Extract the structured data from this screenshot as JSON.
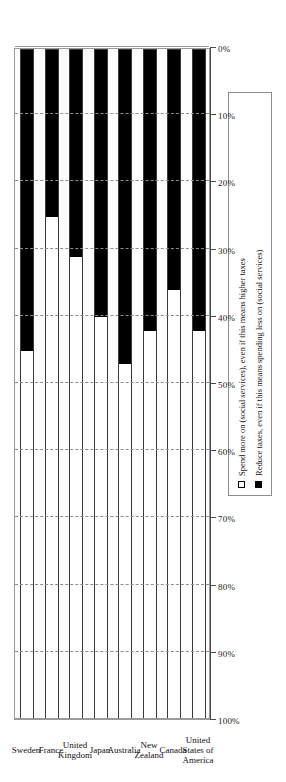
{
  "chart_data": {
    "type": "bar",
    "title": "",
    "subtitle": "",
    "xlabel": "",
    "ylabel": "",
    "orientation": "horizontal-stacked",
    "stacked": true,
    "grid": true,
    "axis_reversed": true,
    "axis_ticks": [
      "100%",
      "90%",
      "80%",
      "70%",
      "60%",
      "50%",
      "40%",
      "30%",
      "20%",
      "10%",
      "0%"
    ],
    "ylim": [
      0,
      100
    ],
    "legend_position": "bottom-right",
    "categories": [
      "Sweden",
      "France",
      "United Kingdom",
      "Japan",
      "Australia",
      "New Zealand",
      "Canada",
      "United States of America"
    ],
    "series": [
      {
        "name": "Spend more on (social services), even if this means higher taxes",
        "color": "#ffffff",
        "values": [
          55,
          75,
          69,
          60,
          53,
          58,
          64,
          58
        ]
      },
      {
        "name": "Reduce taxes, even if this means spending less on (social services)",
        "color": "#000000",
        "values": [
          45,
          25,
          31,
          40,
          47,
          42,
          36,
          42
        ]
      }
    ]
  },
  "legend": {
    "items": [
      {
        "swatch": "spend",
        "label": "Spend more on (social services), even if this means higher taxes"
      },
      {
        "swatch": "reduce",
        "label": "Reduce taxes, even if this means spending less on (social services)"
      }
    ]
  }
}
